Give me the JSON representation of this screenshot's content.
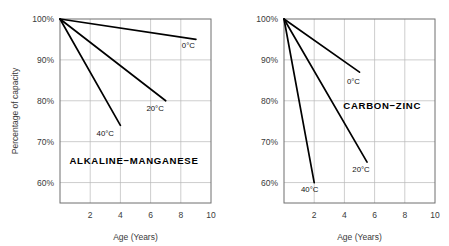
{
  "chart_data": [
    {
      "type": "line",
      "title": "ALKALINE−MANGANESE",
      "xlabel": "Age (Years)",
      "ylabel": "Percentage of capacity",
      "xlim": [
        0,
        10
      ],
      "ylim": [
        55,
        100
      ],
      "xticks": [
        2,
        4,
        6,
        8,
        10
      ],
      "xtick_labels": [
        "2",
        "4",
        "6",
        "8",
        "10"
      ],
      "yticks": [
        60,
        70,
        80,
        90,
        100
      ],
      "ytick_labels": [
        "60%",
        "70%",
        "80%",
        "90%",
        "100%"
      ],
      "grid": true,
      "legend": "inline-annotations",
      "series": [
        {
          "name": "0°C",
          "label": "0°C",
          "x": [
            0,
            9
          ],
          "y": [
            100,
            95
          ]
        },
        {
          "name": "20°C",
          "label": "20°C",
          "x": [
            0,
            7
          ],
          "y": [
            100,
            80
          ]
        },
        {
          "name": "40°C",
          "label": "40°C",
          "x": [
            0,
            4
          ],
          "y": [
            100,
            74
          ]
        }
      ],
      "annotations": [
        {
          "text": "0°C",
          "x": 8.5,
          "y": 93.0
        },
        {
          "text": "20°C",
          "x": 6.3,
          "y": 77.5
        },
        {
          "text": "40°C",
          "x": 3.0,
          "y": 71.5
        },
        {
          "text": "ALKALINE−MANGANESE",
          "x": 4.9,
          "y": 64.5
        }
      ]
    },
    {
      "type": "line",
      "title": "CARBON−ZINC",
      "xlabel": "Age (Years)",
      "ylabel": "",
      "xlim": [
        0,
        10
      ],
      "ylim": [
        55,
        100
      ],
      "xticks": [
        2,
        4,
        6,
        8,
        10
      ],
      "xtick_labels": [
        "2",
        "4",
        "6",
        "8",
        "10"
      ],
      "yticks": [
        60,
        70,
        80,
        90,
        100
      ],
      "ytick_labels": [
        "60%",
        "70%",
        "80%",
        "90%",
        "100%"
      ],
      "grid": true,
      "legend": "inline-annotations",
      "series": [
        {
          "name": "0°C",
          "label": "0°C",
          "x": [
            0,
            5.0
          ],
          "y": [
            100,
            87
          ]
        },
        {
          "name": "20°C",
          "label": "20°C",
          "x": [
            0,
            5.5
          ],
          "y": [
            100,
            65
          ]
        },
        {
          "name": "40°C",
          "label": "40°C",
          "x": [
            0,
            2.0
          ],
          "y": [
            100,
            60
          ]
        }
      ],
      "annotations": [
        {
          "text": "0°C",
          "x": 4.6,
          "y": 84.0
        },
        {
          "text": "20°C",
          "x": 5.1,
          "y": 62.5
        },
        {
          "text": "40°C",
          "x": 1.7,
          "y": 57.8
        },
        {
          "text": "CARBON−ZINC",
          "x": 6.5,
          "y": 78.0
        }
      ]
    }
  ],
  "left_chart": {
    "title": "ALKALINE−MANGANESE",
    "xlabel": "Age (Years)",
    "ylabel": "Percentage of capacity",
    "ytick_labels": [
      "100%",
      "90%",
      "80%",
      "70%",
      "60%"
    ],
    "xtick_labels": [
      "2",
      "4",
      "6",
      "8",
      "10"
    ],
    "series_labels": [
      "0°C",
      "20°C",
      "40°C"
    ]
  },
  "right_chart": {
    "title": "CARBON−ZINC",
    "xlabel": "Age (Years)",
    "ylabel": "",
    "ytick_labels": [
      "100%",
      "90%",
      "80%",
      "70%",
      "60%"
    ],
    "xtick_labels": [
      "2",
      "4",
      "6",
      "8",
      "10"
    ],
    "series_labels": [
      "0°C",
      "20°C",
      "40°C"
    ]
  },
  "colors": {
    "background": "#ffffff",
    "line": "#000000",
    "grid": "#b9b9b9",
    "frame": "#6f6f6f",
    "text": "#2b2b2b"
  }
}
